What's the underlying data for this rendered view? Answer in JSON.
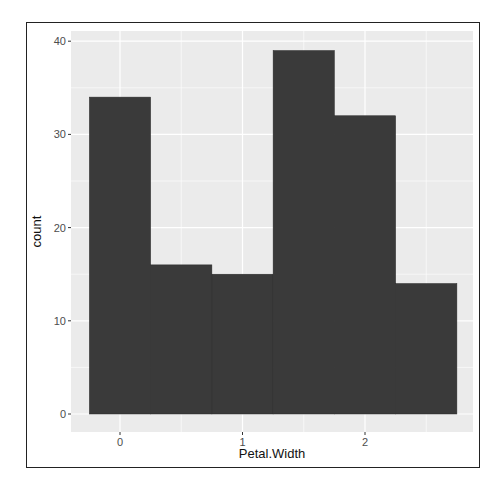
{
  "chart_data": {
    "type": "bar",
    "subtype": "histogram",
    "title": "",
    "xlabel": "Petal.Width",
    "ylabel": "count",
    "bin_width": 0.5,
    "categories": [
      "0",
      "0.5",
      "1",
      "1.5",
      "2",
      "2.5"
    ],
    "bin_centers": [
      0,
      0.5,
      1.0,
      1.5,
      2.0,
      2.5
    ],
    "values": [
      34,
      16,
      15,
      39,
      32,
      14
    ],
    "xlim": [
      -0.52,
      2.77
    ],
    "ylim": [
      -2,
      41
    ],
    "x_ticks": [
      0,
      1,
      2
    ],
    "x_tick_labels": [
      "0",
      "1",
      "2"
    ],
    "y_ticks": [
      0,
      10,
      20,
      30,
      40
    ],
    "y_tick_labels": [
      "0",
      "10",
      "20",
      "30",
      "40"
    ],
    "grid": true,
    "legend": "none",
    "colors": {
      "bar_fill": "#3a3a3a",
      "panel_bg": "#ebebeb",
      "grid": "#ffffff"
    }
  }
}
